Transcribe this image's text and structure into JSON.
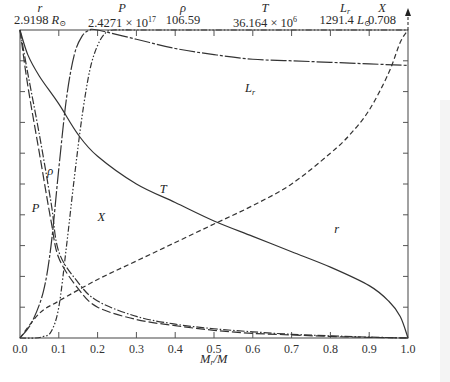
{
  "header": {
    "columns": [
      {
        "name": "r",
        "name_sub": "",
        "value": "2.9198",
        "unit": "R",
        "unit_sub": "⊙",
        "x": 40
      },
      {
        "name": "P",
        "name_sub": "",
        "value": "2.4271 × 10",
        "exp": "17",
        "x": 122
      },
      {
        "name": "ρ",
        "name_sub": "",
        "value": "106.59",
        "x": 183
      },
      {
        "name": "T",
        "name_sub": "",
        "value": "36.164 × 10",
        "exp": "6",
        "x": 265
      },
      {
        "name": "L",
        "name_sub": "r",
        "value": "1291.4",
        "unit": "L",
        "unit_sub": "⊙",
        "x": 345
      },
      {
        "name": "X",
        "name_sub": "",
        "value": "0.708",
        "x": 382
      }
    ]
  },
  "chart_data": {
    "type": "line",
    "title": "",
    "xlabel": "M_r/M",
    "ylabel": "",
    "xlim": [
      0.0,
      1.0
    ],
    "ylim": [
      0.0,
      1.0
    ],
    "x_ticks": [
      "0.0",
      "0.1",
      "0.2",
      "0.3",
      "0.4",
      "0.5",
      "0.6",
      "0.7",
      "0.8",
      "0.9",
      "1.0"
    ],
    "y_ticks_count": 10,
    "grid": false,
    "legend": "inline labels",
    "normalization_note": "Each curve normalized to its maximum value shown in the header",
    "series": [
      {
        "name": "r",
        "style": "dashed",
        "label_pos": [
          0.81,
          0.34
        ],
        "x": [
          0.0,
          0.05,
          0.1,
          0.2,
          0.3,
          0.4,
          0.5,
          0.6,
          0.7,
          0.8,
          0.85,
          0.9,
          0.95,
          0.98,
          1.0
        ],
        "y": [
          0.0,
          0.08,
          0.12,
          0.19,
          0.25,
          0.31,
          0.37,
          0.43,
          0.5,
          0.6,
          0.66,
          0.74,
          0.86,
          0.96,
          1.05
        ]
      },
      {
        "name": "P",
        "style": "long-dash",
        "label_pos": [
          0.03,
          0.41
        ],
        "x": [
          0.0,
          0.02,
          0.05,
          0.08,
          0.1,
          0.15,
          0.2,
          0.3,
          0.4,
          0.5,
          0.6,
          0.7,
          0.8,
          0.9,
          1.0
        ],
        "y": [
          1.0,
          0.82,
          0.6,
          0.38,
          0.26,
          0.16,
          0.1,
          0.06,
          0.04,
          0.025,
          0.015,
          0.01,
          0.005,
          0.002,
          0.0
        ]
      },
      {
        "name": "ρ",
        "style": "dash-dot",
        "label_pos": [
          0.07,
          0.53
        ],
        "x": [
          0.0,
          0.02,
          0.05,
          0.08,
          0.1,
          0.15,
          0.2,
          0.3,
          0.4,
          0.5,
          0.6,
          0.7,
          0.8,
          0.9,
          1.0
        ],
        "y": [
          1.0,
          0.86,
          0.66,
          0.44,
          0.28,
          0.18,
          0.12,
          0.07,
          0.045,
          0.03,
          0.02,
          0.012,
          0.007,
          0.003,
          0.0
        ]
      },
      {
        "name": "T",
        "style": "solid",
        "label_pos": [
          0.36,
          0.47
        ],
        "x": [
          0.0,
          0.02,
          0.05,
          0.1,
          0.15,
          0.2,
          0.3,
          0.4,
          0.5,
          0.6,
          0.7,
          0.8,
          0.9,
          0.95,
          0.98,
          1.0
        ],
        "y": [
          1.0,
          0.92,
          0.85,
          0.76,
          0.66,
          0.59,
          0.5,
          0.44,
          0.38,
          0.33,
          0.28,
          0.23,
          0.17,
          0.12,
          0.07,
          0.0
        ]
      },
      {
        "name": "L_r",
        "style": "long-short-dash",
        "label_pos": [
          0.58,
          0.8
        ],
        "x": [
          0.0,
          0.03,
          0.06,
          0.08,
          0.1,
          0.12,
          0.14,
          0.16,
          0.18,
          0.2,
          0.3,
          0.4,
          0.5,
          0.6,
          0.7,
          0.8,
          0.9,
          1.0
        ],
        "y": [
          0.0,
          0.05,
          0.15,
          0.3,
          0.55,
          0.78,
          0.92,
          0.98,
          1.0,
          1.0,
          0.97,
          0.94,
          0.92,
          0.905,
          0.9,
          0.895,
          0.89,
          0.885
        ]
      },
      {
        "name": "X",
        "style": "dash-dot-dot",
        "label_pos": [
          0.2,
          0.38
        ],
        "x": [
          0.0,
          0.04,
          0.06,
          0.08,
          0.1,
          0.12,
          0.14,
          0.16,
          0.18,
          0.2,
          0.22,
          0.24,
          0.3,
          0.5,
          0.7,
          0.9,
          1.0
        ],
        "y": [
          0.0,
          0.0,
          0.005,
          0.02,
          0.1,
          0.3,
          0.52,
          0.72,
          0.87,
          0.95,
          0.99,
          1.0,
          1.0,
          1.0,
          1.0,
          1.0,
          1.0
        ]
      }
    ]
  }
}
